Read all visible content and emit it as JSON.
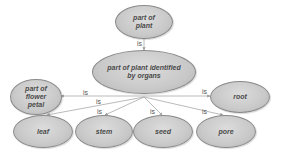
{
  "diagram": {
    "nodes": [
      {
        "id": "part-of-plant",
        "label": "part of plant",
        "lines": [
          "part of",
          "plant"
        ]
      },
      {
        "id": "organs",
        "label": "part of plant identified by organs",
        "lines": [
          "part of plant identified",
          "by organs"
        ]
      },
      {
        "id": "flower-petal",
        "label": "part of flower petal",
        "lines": [
          "part of",
          "flower",
          "petal"
        ]
      },
      {
        "id": "root",
        "label": "root",
        "lines": [
          "root"
        ]
      },
      {
        "id": "leaf",
        "label": "leaf",
        "lines": [
          "leaf"
        ]
      },
      {
        "id": "stem",
        "label": "stem",
        "lines": [
          "stem"
        ]
      },
      {
        "id": "seed",
        "label": "seed",
        "lines": [
          "seed"
        ]
      },
      {
        "id": "pore",
        "label": "pore",
        "lines": [
          "pore"
        ]
      }
    ],
    "edges": [
      {
        "from": "part-of-plant",
        "to": "organs",
        "label": "is"
      },
      {
        "from": "organs",
        "to": "flower-petal",
        "label": "is"
      },
      {
        "from": "organs",
        "to": "root",
        "label": "is"
      },
      {
        "from": "organs",
        "to": "leaf",
        "label": "is"
      },
      {
        "from": "organs",
        "to": "stem",
        "label": "is"
      },
      {
        "from": "organs",
        "to": "seed",
        "label": "is"
      },
      {
        "from": "organs",
        "to": "pore",
        "label": "is"
      }
    ]
  }
}
